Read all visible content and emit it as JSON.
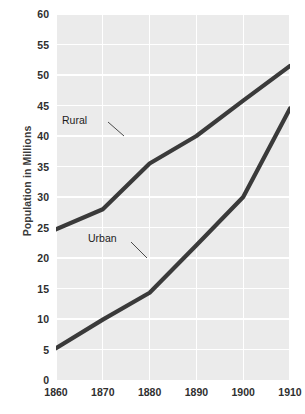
{
  "chart_data": {
    "type": "line",
    "title": "",
    "xlabel": "",
    "ylabel": "Population in Millions",
    "x": [
      1860,
      1870,
      1880,
      1890,
      1900,
      1910
    ],
    "xlim": [
      1860,
      1910
    ],
    "ylim": [
      0,
      60
    ],
    "x_ticks": [
      "1860",
      "1870",
      "1880",
      "1890",
      "1900",
      "1910"
    ],
    "y_ticks": [
      "0",
      "5",
      "10",
      "15",
      "20",
      "25",
      "30",
      "35",
      "40",
      "45",
      "50",
      "55",
      "60"
    ],
    "y_tick_values": [
      0,
      5,
      10,
      15,
      20,
      25,
      30,
      35,
      40,
      45,
      50,
      55,
      60
    ],
    "grid": true,
    "grid_color": "#ffffff",
    "panel_background": "#ebebeb",
    "legend": "inline-annotations",
    "series": [
      {
        "name": "Rural",
        "color": "#3a3a3a",
        "values": [
          24.7,
          28.0,
          35.5,
          40.0,
          45.8,
          51.5
        ]
      },
      {
        "name": "Urban",
        "color": "#3a3a3a",
        "values": [
          5.2,
          9.9,
          14.3,
          22.1,
          30.0,
          44.5
        ]
      }
    ],
    "annotations": [
      {
        "label": "Rural",
        "series": "Rural"
      },
      {
        "label": "Urban",
        "series": "Urban"
      }
    ]
  }
}
